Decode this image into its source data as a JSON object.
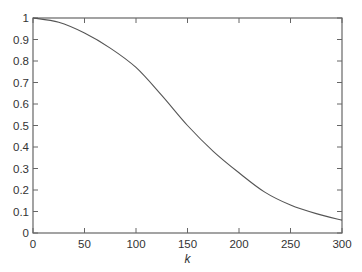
{
  "chart_data": {
    "type": "line",
    "title": "",
    "xlabel": "k",
    "ylabel": "",
    "xlim": [
      0,
      300
    ],
    "ylim": [
      0,
      1
    ],
    "grid": false,
    "legend": null,
    "x_ticks": [
      "0",
      "50",
      "100",
      "150",
      "200",
      "250",
      "300"
    ],
    "y_ticks": [
      "0",
      "0.1",
      "0.2",
      "0.3",
      "0.4",
      "0.5",
      "0.6",
      "0.7",
      "0.8",
      "0.9",
      "1"
    ],
    "series": [
      {
        "name": "curve",
        "color": "#555555",
        "x": [
          0,
          25,
          50,
          75,
          100,
          125,
          150,
          175,
          200,
          225,
          250,
          275,
          300
        ],
        "y": [
          1.0,
          0.98,
          0.93,
          0.86,
          0.77,
          0.64,
          0.5,
          0.38,
          0.28,
          0.19,
          0.13,
          0.09,
          0.06
        ]
      }
    ]
  },
  "plot_area": {
    "left": 33,
    "top": 18,
    "right": 342,
    "bottom": 233
  }
}
